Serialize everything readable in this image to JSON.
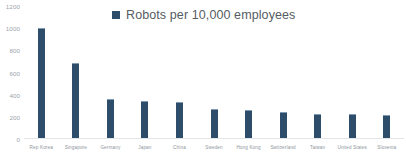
{
  "chart_data": {
    "type": "bar",
    "title": "",
    "xlabel": "",
    "ylabel": "",
    "legend": [
      "Robots per 10,000 employees"
    ],
    "legend_position": "top-center",
    "grid": false,
    "ylim": [
      0,
      1200
    ],
    "yticks": [
      1200,
      1000,
      800,
      600,
      400,
      200,
      0
    ],
    "ytick_labels": [
      "1200",
      "1000",
      "800",
      "600",
      "400",
      "200",
      "0"
    ],
    "categories": [
      "Rep Korea",
      "Singapore",
      "Germany",
      "Japan",
      "China",
      "Sweden",
      "Hong Kong",
      "Switzerland",
      "Taiwan",
      "United States",
      "Slovenia"
    ],
    "values": [
      1000,
      690,
      360,
      345,
      335,
      275,
      265,
      240,
      230,
      225,
      220
    ],
    "series": [
      {
        "name": "Robots per 10,000 employees",
        "values": [
          1000,
          690,
          360,
          345,
          335,
          275,
          265,
          240,
          230,
          225,
          220
        ]
      }
    ],
    "colors": {
      "bar": "#2e4d6b",
      "bar_highlight": "#7f99b2",
      "axis_line": "#e3e6e9",
      "tick_text": "#9aa3ab",
      "legend_text": "#555c63",
      "background": "#ffffff"
    }
  },
  "legend": {
    "swatch_icon": "legend-square-icon",
    "label": "Robots per 10,000 employees"
  }
}
